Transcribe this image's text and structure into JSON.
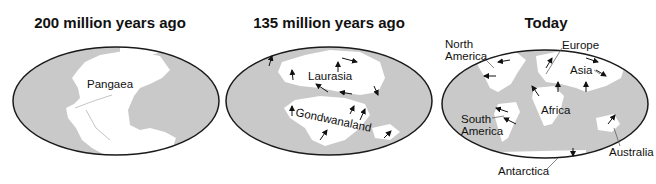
{
  "colors": {
    "ocean": "#c9c9c9",
    "land": "#ffffff",
    "outline": "#1a1a1a",
    "arrow": "#111111"
  },
  "panels": [
    {
      "title": "200 million years ago",
      "labels": [
        "Pangaea"
      ]
    },
    {
      "title": "135 million years ago",
      "labels": [
        "Laurasia",
        "Gondwanaland"
      ]
    },
    {
      "title": "Today",
      "labels": [
        "North America",
        "Europe",
        "Asia",
        "Africa",
        "South America",
        "Australia",
        "Antarctica"
      ]
    }
  ]
}
